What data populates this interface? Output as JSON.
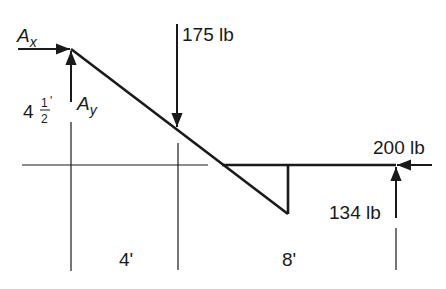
{
  "diagram": {
    "type": "free-body diagram",
    "colors": {
      "ink": "#1a1a1a",
      "background": "#ffffff"
    },
    "forces": {
      "ax": {
        "symbol": "A",
        "subscript": "x"
      },
      "ay": {
        "symbol": "A",
        "subscript": "y"
      },
      "load": {
        "label": "175 lb"
      },
      "horizontal_right": {
        "label": "200 lb"
      },
      "vertical_right": {
        "label": "134 lb"
      }
    },
    "dimensions": {
      "height": {
        "whole": "4",
        "num": "1",
        "den": "2",
        "unit": "'"
      },
      "span_left": {
        "label": "4'"
      },
      "span_right": {
        "label": "8'"
      }
    }
  }
}
